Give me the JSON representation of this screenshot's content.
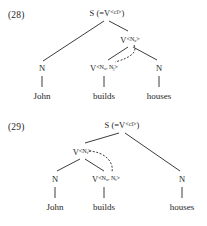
{
  "page": {
    "width": 207,
    "height": 226,
    "background": "#ffffff",
    "ink": "#262626"
  },
  "figures": [
    {
      "id": "figure-28",
      "number": "(28)",
      "number_pos": {
        "x": 8,
        "y": 10
      },
      "nodes": [
        {
          "name": "root-s",
          "html": "S (=V<span class=\"ang\">&lt;cl&gt;</span>)",
          "x": 107,
          "y": 9
        },
        {
          "name": "n-john",
          "html": "N",
          "x": 42,
          "y": 64
        },
        {
          "name": "v-na",
          "html": "V<span class=\"ang\">&lt;N<sub>a</sub>&gt;</span>",
          "x": 130,
          "y": 36
        },
        {
          "name": "v-na-nj",
          "html": "V<span class=\"ang\">&lt;N<sub>a</sub>, N<sub>j</sub>&gt;</span>",
          "x": 104,
          "y": 64
        },
        {
          "name": "n-houses",
          "html": "N",
          "x": 159,
          "y": 64
        }
      ],
      "edges": [
        {
          "name": "edge-root-to-n-john",
          "x1": 104,
          "y1": 21,
          "x2": 43,
          "y2": 61
        },
        {
          "name": "edge-root-to-v-na",
          "x1": 109,
          "y1": 21,
          "x2": 128,
          "y2": 31
        },
        {
          "name": "edge-v-na-to-v-na-nj",
          "x1": 128,
          "y1": 47,
          "x2": 108,
          "y2": 60
        },
        {
          "name": "edge-v-na-to-n-houses",
          "x1": 133,
          "y1": 47,
          "x2": 157,
          "y2": 60
        },
        {
          "name": "stem-john",
          "x1": 42,
          "y1": 76,
          "x2": 42,
          "y2": 87
        },
        {
          "name": "stem-builds",
          "x1": 104,
          "y1": 76,
          "x2": 104,
          "y2": 87
        },
        {
          "name": "stem-houses",
          "x1": 159,
          "y1": 76,
          "x2": 159,
          "y2": 87
        }
      ],
      "dashed_arc": {
        "name": "dashed-dependency-arc",
        "path": "M 134 45 C 138 52 130 58 115 62"
      },
      "leaves": [
        {
          "name": "leaf-john",
          "text": "John",
          "x": 42,
          "y": 92
        },
        {
          "name": "leaf-builds",
          "text": "builds",
          "x": 104,
          "y": 92
        },
        {
          "name": "leaf-houses",
          "text": "houses",
          "x": 159,
          "y": 92
        }
      ]
    },
    {
      "id": "figure-29",
      "number": "(29)",
      "number_pos": {
        "x": 8,
        "y": 9
      },
      "nodes": [
        {
          "name": "root-s",
          "html": "S (=V<span class=\"ang\">&lt;cl&gt;</span>)",
          "x": 122,
          "y": 8
        },
        {
          "name": "v-nt",
          "html": "V<span class=\"ang\">&lt;N<sub>t</sub>&gt;</span>",
          "x": 82,
          "y": 35
        },
        {
          "name": "n-john",
          "html": "N",
          "x": 55,
          "y": 62
        },
        {
          "name": "v-na-nt",
          "html": "V<span class=\"ang\">&lt;N<sub>a</sub>, N<sub>t</sub>&gt;</span>",
          "x": 106,
          "y": 62
        },
        {
          "name": "n-houses",
          "html": "N",
          "x": 182,
          "y": 62
        }
      ],
      "edges": [
        {
          "name": "edge-root-to-v-nt",
          "x1": 119,
          "y1": 20,
          "x2": 85,
          "y2": 30
        },
        {
          "name": "edge-root-to-n-houses",
          "x1": 125,
          "y1": 20,
          "x2": 180,
          "y2": 58
        },
        {
          "name": "edge-v-nt-to-n-john",
          "x1": 80,
          "y1": 46,
          "x2": 57,
          "y2": 58
        },
        {
          "name": "edge-v-nt-to-v-na-nt",
          "x1": 85,
          "y1": 46,
          "x2": 104,
          "y2": 58
        },
        {
          "name": "stem-john",
          "x1": 55,
          "y1": 74,
          "x2": 55,
          "y2": 85
        },
        {
          "name": "stem-builds",
          "x1": 104,
          "y1": 74,
          "x2": 104,
          "y2": 85
        },
        {
          "name": "stem-houses",
          "x1": 182,
          "y1": 74,
          "x2": 182,
          "y2": 85
        }
      ],
      "dashed_arc": {
        "name": "dashed-dependency-arc",
        "path": "M 89 38 C 104 39 114 48 112 59"
      },
      "leaves": [
        {
          "name": "leaf-john",
          "text": "John",
          "x": 55,
          "y": 90
        },
        {
          "name": "leaf-builds",
          "text": "builds",
          "x": 104,
          "y": 90
        },
        {
          "name": "leaf-houses",
          "text": "houses",
          "x": 182,
          "y": 90
        }
      ]
    }
  ]
}
